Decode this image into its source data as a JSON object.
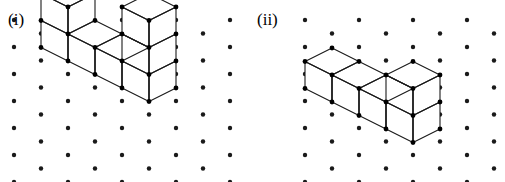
{
  "figure": {
    "type": "isometric-cube-diagram",
    "background_color": "#ffffff",
    "ink_color": "#1a1a1a",
    "face_color": "#ffffff",
    "dot_radius": 2.2,
    "vertex_radius": 2.4,
    "panels": [
      {
        "id": "i",
        "label": "(i)",
        "label_x": 8,
        "label_y": 11,
        "origin_x": 0,
        "lattice": {
          "x_start": 14,
          "y_start": 20,
          "dx": 27,
          "dy": 13.5,
          "cols": 9,
          "rows": 12,
          "comment": "triangular lattice; alternate columns shifted down by dy"
        },
        "iso": {
          "unit_x": 27,
          "unit_y": 13.5,
          "unit_z": 27,
          "base_x": 68,
          "base_y": 34
        },
        "cubes": [
          {
            "x": 0,
            "y": 0,
            "z": 0
          },
          {
            "x": 0,
            "y": 0,
            "z": 1
          },
          {
            "x": 1,
            "y": 0,
            "z": 0
          },
          {
            "x": 2,
            "y": 0,
            "z": 0
          },
          {
            "x": 3,
            "y": 0,
            "z": 0
          },
          {
            "x": 3,
            "y": 0,
            "z": 1
          },
          {
            "x": 3,
            "y": 0,
            "z": 2
          }
        ],
        "cube_count": 7,
        "shape_note": "two-high stack at left, one-high middle, three-high tower at right"
      },
      {
        "id": "ii",
        "label": "(ii)",
        "label_x": 5,
        "label_y": 11,
        "origin_x": 252,
        "lattice": {
          "x_start": 53,
          "y_start": 20,
          "dx": 27,
          "dy": 13.5,
          "cols": 9,
          "rows": 12,
          "comment": "triangular lattice; alternate columns shifted down by dy"
        },
        "iso": {
          "unit_x": 27,
          "unit_y": 13.5,
          "unit_z": 27,
          "base_x": 80,
          "base_y": 75
        },
        "cubes": [
          {
            "x": 0,
            "y": 0,
            "z": 0
          },
          {
            "x": 1,
            "y": 0,
            "z": 0
          },
          {
            "x": 2,
            "y": 0,
            "z": 0
          },
          {
            "x": 3,
            "y": 0,
            "z": 0
          },
          {
            "x": 3,
            "y": 0,
            "z": 1
          }
        ],
        "cube_count": 5,
        "shape_note": "row of three cubes stepping down-right to a two-high stack at the right end"
      }
    ]
  }
}
